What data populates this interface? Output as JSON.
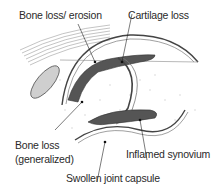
{
  "diagram": {
    "labels": {
      "bone_loss_erosion": "Bone loss/ erosion",
      "cartilage_loss": "Cartilage loss",
      "bone_loss_generalized_line1": "Bone loss",
      "bone_loss_generalized_line2": "(generalized)",
      "inflamed_synovium": "Inflamed synovium",
      "swollen_joint_capsule": "Swollen joint capsule"
    },
    "colors": {
      "outline": "#3a3a3a",
      "synovium_fill": "#555555",
      "bone_dots": "#d8d8d8",
      "background": "#ffffff"
    }
  }
}
